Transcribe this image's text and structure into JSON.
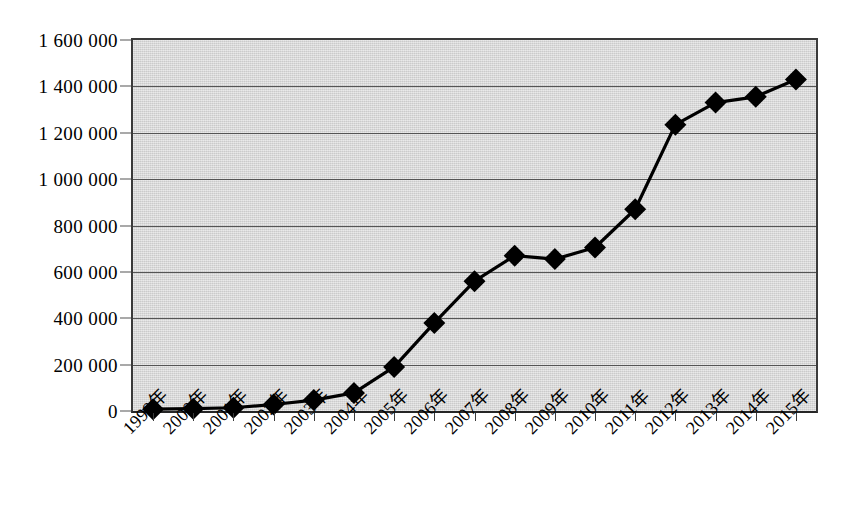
{
  "chart_data": {
    "type": "line",
    "title": "",
    "subtitle": "",
    "xlabel": "",
    "ylabel": "",
    "categories": [
      "1999年",
      "2000年",
      "2001年",
      "2002年",
      "2003年",
      "2004年",
      "2005年",
      "2006年",
      "2007年",
      "2008年",
      "2009年",
      "2010年",
      "2011年",
      "2012年",
      "2013年",
      "2014年",
      "2015年"
    ],
    "values": [
      8000,
      10000,
      14000,
      28000,
      47000,
      78000,
      190000,
      380000,
      560000,
      670000,
      655000,
      705000,
      870000,
      1235000,
      1330000,
      1355000,
      1430000
    ],
    "series": [
      {
        "name": "",
        "values": [
          8000,
          10000,
          14000,
          28000,
          47000,
          78000,
          190000,
          380000,
          560000,
          670000,
          655000,
          705000,
          870000,
          1235000,
          1330000,
          1355000,
          1430000
        ]
      }
    ],
    "ylim": [
      0,
      1600000
    ],
    "ytick_values": [
      0,
      200000,
      400000,
      600000,
      800000,
      1000000,
      1200000,
      1400000,
      1600000
    ],
    "ytick_labels": [
      "0",
      "200 000",
      "400 000",
      "600 000",
      "800 000",
      "1 000 000",
      "1 200 000",
      "1 400 000",
      "1 600 000"
    ],
    "grid": true,
    "grid_axis": "y",
    "legend": false,
    "legend_position": "none",
    "marker": "diamond",
    "line_color": "#000000",
    "marker_color": "#000000",
    "plot_background": "#d6d6d6",
    "page_background": "#ffffff",
    "gridline_color": "#555555",
    "axis_color": "#3a3a3a",
    "xtick_label_rotation": -45
  },
  "axes": {
    "y_axis_name": "y-axis",
    "x_axis_name": "x-axis"
  },
  "caption": {
    "fragment": ""
  }
}
